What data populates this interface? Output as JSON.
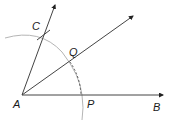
{
  "diagram": {
    "points": {
      "A": {
        "label": "A",
        "x": 22,
        "y": 95
      },
      "B": {
        "label": "B",
        "x": 163,
        "y": 95
      },
      "C": {
        "label": "C",
        "x": 55,
        "y": 5
      },
      "P": {
        "label": "P",
        "x": 81,
        "y": 95
      },
      "Q": {
        "label": "Q",
        "x": 70,
        "y": 62
      }
    },
    "labels": {
      "A": "A",
      "B": "B",
      "C": "C",
      "P": "P",
      "Q": "Q"
    },
    "colors": {
      "line": "#333333",
      "arc": "#b0b0b0",
      "dashed_arc": "#555555",
      "label": "#1a1a1a",
      "background": "#ffffff"
    }
  }
}
